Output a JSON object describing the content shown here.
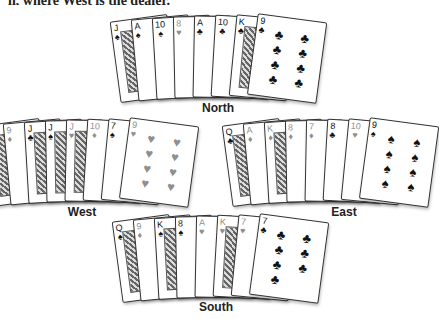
{
  "caption_partial": "ll, where West is the dealer.",
  "hands": {
    "north": {
      "label": "North",
      "cards": [
        {
          "rank": "J",
          "suit": "♠",
          "color": "black"
        },
        {
          "rank": "A",
          "suit": "♠",
          "color": "black"
        },
        {
          "rank": "10",
          "suit": "♠",
          "color": "black"
        },
        {
          "rank": "8",
          "suit": "♥",
          "color": "red"
        },
        {
          "rank": "A",
          "suit": "♣",
          "color": "black"
        },
        {
          "rank": "10",
          "suit": "♣",
          "color": "black"
        },
        {
          "rank": "K",
          "suit": "♣",
          "color": "black"
        },
        {
          "rank": "9",
          "suit": "♣",
          "color": "black"
        }
      ]
    },
    "west": {
      "label": "West",
      "cards": [
        {
          "rank": "Q",
          "suit": "♥",
          "color": "red"
        },
        {
          "rank": "9",
          "suit": "♦",
          "color": "red"
        },
        {
          "rank": "J",
          "suit": "♣",
          "color": "black"
        },
        {
          "rank": "J",
          "suit": "♠",
          "color": "black"
        },
        {
          "rank": "J",
          "suit": "♥",
          "color": "red"
        },
        {
          "rank": "10",
          "suit": "♦",
          "color": "red"
        },
        {
          "rank": "7",
          "suit": "♠",
          "color": "black"
        },
        {
          "rank": "9",
          "suit": "♥",
          "color": "red"
        }
      ]
    },
    "east": {
      "label": "East",
      "cards": [
        {
          "rank": "Q",
          "suit": "♣",
          "color": "black"
        },
        {
          "rank": "A",
          "suit": "♦",
          "color": "red"
        },
        {
          "rank": "K",
          "suit": "♦",
          "color": "red"
        },
        {
          "rank": "8",
          "suit": "♦",
          "color": "red"
        },
        {
          "rank": "7",
          "suit": "♦",
          "color": "red"
        },
        {
          "rank": "8",
          "suit": "♣",
          "color": "black"
        },
        {
          "rank": "10",
          "suit": "♥",
          "color": "red"
        },
        {
          "rank": "9",
          "suit": "♠",
          "color": "black"
        }
      ]
    },
    "south": {
      "label": "South",
      "cards": [
        {
          "rank": "Q",
          "suit": "♠",
          "color": "black"
        },
        {
          "rank": "9",
          "suit": "♦",
          "color": "red"
        },
        {
          "rank": "K",
          "suit": "♠",
          "color": "black"
        },
        {
          "rank": "8",
          "suit": "♠",
          "color": "black"
        },
        {
          "rank": "A",
          "suit": "♥",
          "color": "red"
        },
        {
          "rank": "K",
          "suit": "♥",
          "color": "red"
        },
        {
          "rank": "7",
          "suit": "♥",
          "color": "red"
        },
        {
          "rank": "7",
          "suit": "♣",
          "color": "black"
        }
      ]
    }
  }
}
